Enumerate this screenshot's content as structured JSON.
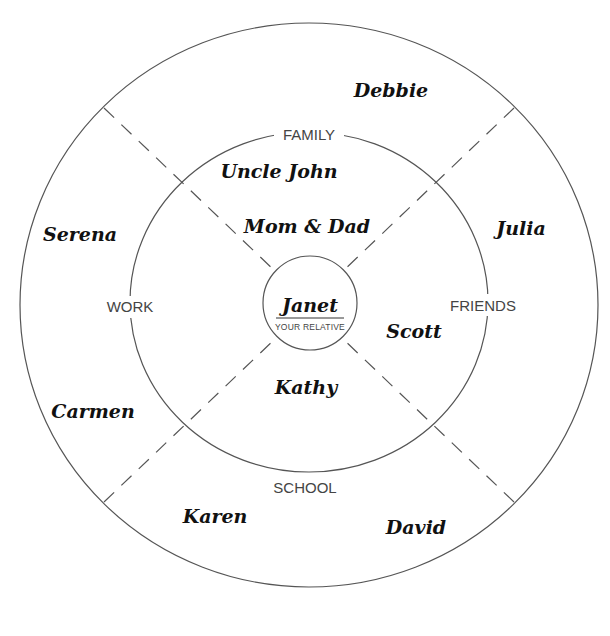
{
  "diagram": {
    "center": {
      "name": "Janet",
      "subtitle": "YOUR RELATIVE"
    },
    "categories": {
      "top": "FAMILY",
      "right": "FRIENDS",
      "bottom": "SCHOOL",
      "left": "WORK"
    },
    "people": {
      "family_inner": [
        "Mom & Dad",
        "Uncle John"
      ],
      "family_outer": [
        "Debbie"
      ],
      "friends_inner": [
        "Scott"
      ],
      "friends_outer": [
        "Julia"
      ],
      "school_inner": [
        "Kathy"
      ],
      "school_outer": [
        "Karen",
        "David"
      ],
      "work_outer": [
        "Serena",
        "Carmen"
      ]
    },
    "colors": {
      "line": "#555555",
      "text": "#111111",
      "label": "#444444",
      "background": "#ffffff"
    }
  }
}
